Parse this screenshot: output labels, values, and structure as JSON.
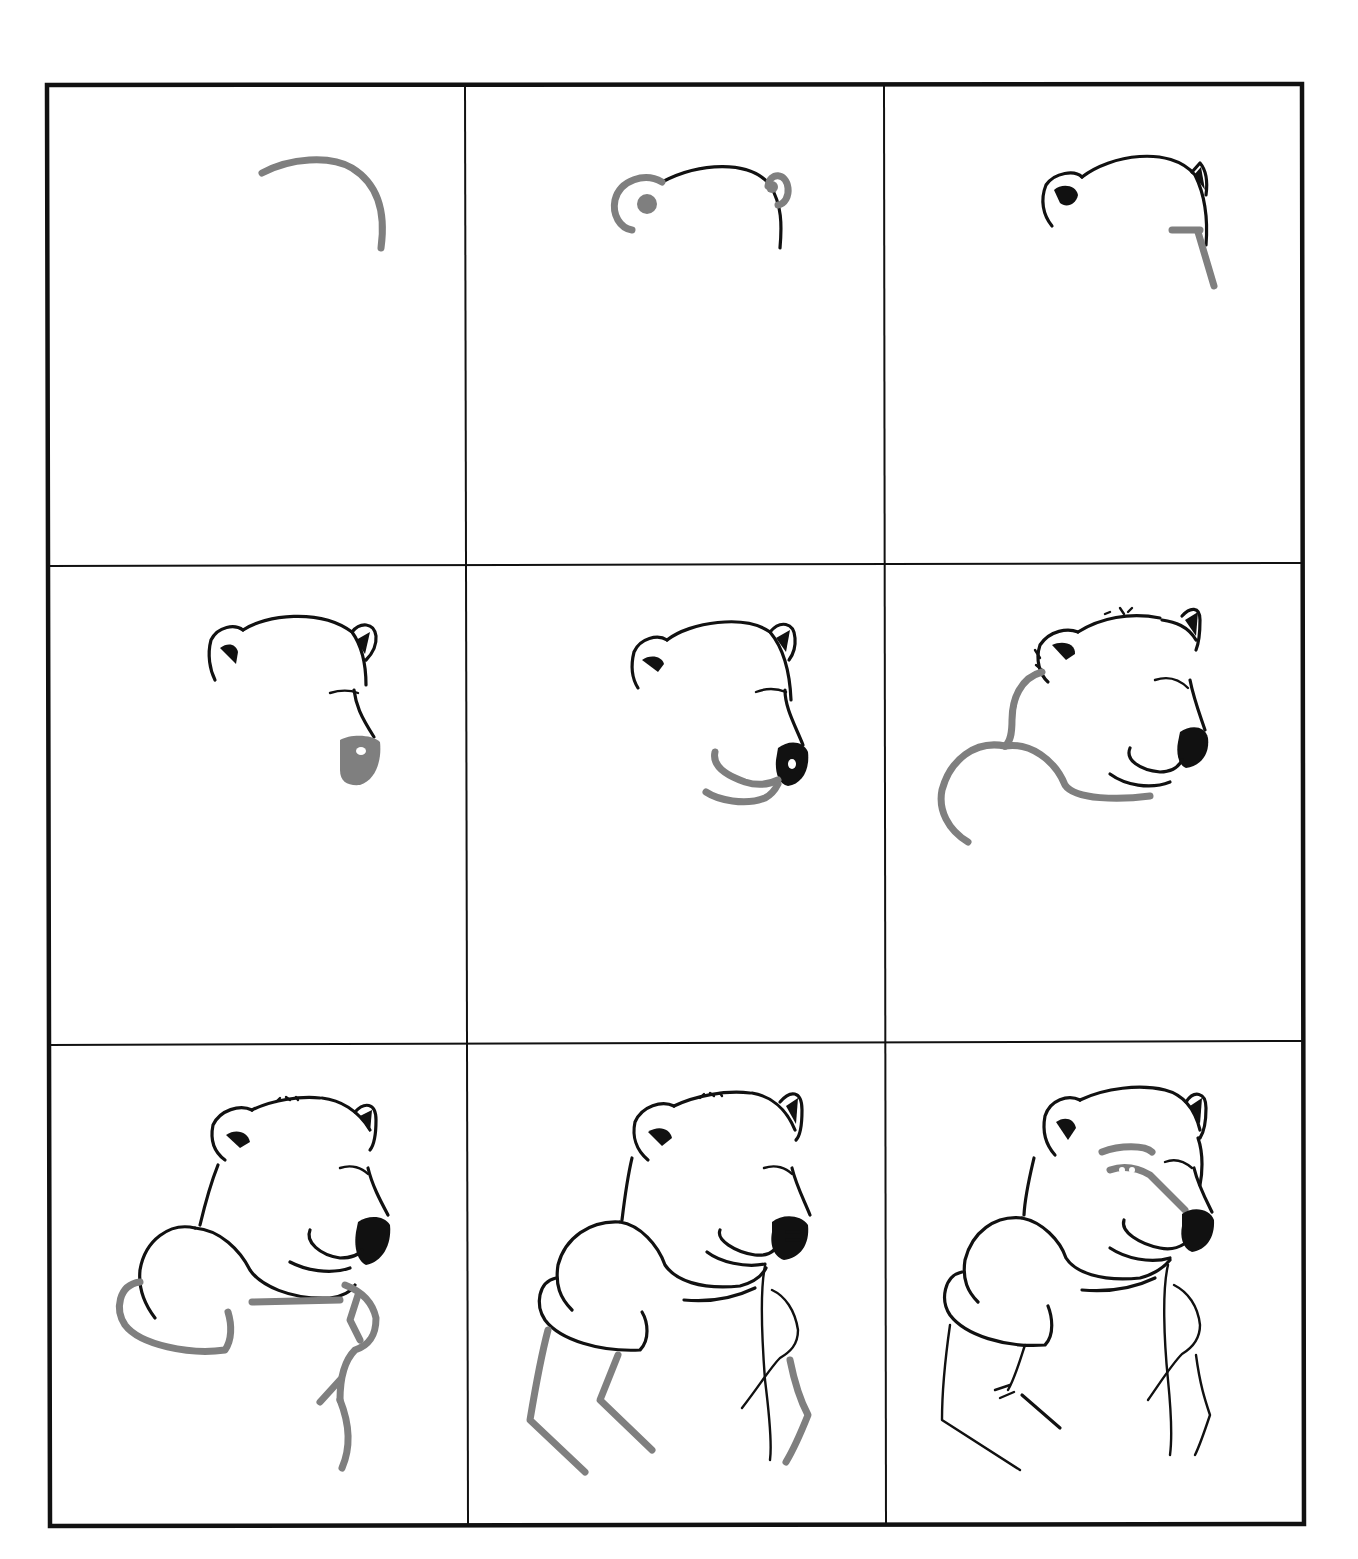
{
  "figure": {
    "type": "step-by-step drawing tutorial",
    "layout": {
      "rows": 3,
      "columns": 3
    },
    "colors": {
      "ink": "#111111",
      "new_stroke_gray": "#7f7f7f",
      "background": "#ffffff"
    },
    "steps": [
      {
        "index": 1,
        "description": "Gray arc for top of head"
      },
      {
        "index": 2,
        "description": "Head outline inked; gray ears added"
      },
      {
        "index": 3,
        "description": "Ears inked; gray guide for forehead/snout line"
      },
      {
        "index": 4,
        "description": "Snout line and eye inked; gray nose block"
      },
      {
        "index": 5,
        "description": "Nose inked; gray mouth and chin lines"
      },
      {
        "index": 6,
        "description": "Mouth inked; gray neck and shoulder curves"
      },
      {
        "index": 7,
        "description": "Shoulder inked; gray paw and arm guides"
      },
      {
        "index": 8,
        "description": "Paws inked; gray leg/arm lines"
      },
      {
        "index": 9,
        "description": "Body inked; gray shading around eye and muzzle"
      }
    ]
  }
}
